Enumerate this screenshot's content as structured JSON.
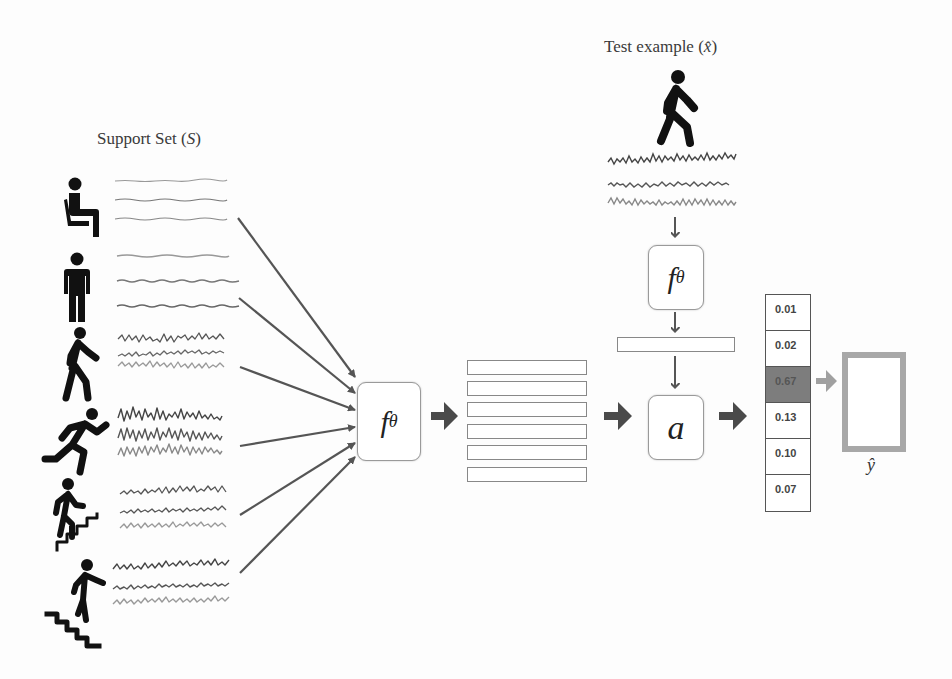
{
  "support_set": {
    "title_prefix": "Support Set (",
    "title_var": "S",
    "title_suffix": ")",
    "classes": [
      {
        "name": "sitting",
        "icon": "sitting-person-icon",
        "signal_activity": "low"
      },
      {
        "name": "standing",
        "icon": "standing-person-icon",
        "signal_activity": "low"
      },
      {
        "name": "walking",
        "icon": "walking-person-icon",
        "signal_activity": "medium"
      },
      {
        "name": "running",
        "icon": "running-person-icon",
        "signal_activity": "high"
      },
      {
        "name": "upstairs",
        "icon": "climbing-stairs-icon",
        "signal_activity": "medium"
      },
      {
        "name": "downstairs",
        "icon": "descending-stairs-icon",
        "signal_activity": "medium"
      }
    ]
  },
  "test_example": {
    "title_prefix": "Test example (",
    "title_var": "x̂",
    "title_suffix": ")",
    "icon": "walking-person-icon"
  },
  "encoder": {
    "label": "f",
    "subscript": "θ"
  },
  "attention": {
    "label": "a"
  },
  "probabilities": {
    "values": [
      "0.01",
      "0.02",
      "0.67",
      "0.13",
      "0.10",
      "0.07"
    ],
    "highlight_index": 2
  },
  "prediction": {
    "label": "ŷ",
    "icon": "walking-person-icon"
  },
  "colors": {
    "arrow": "#555555",
    "block_arrow": "#4a4a4a",
    "highlight_cell": "#7d7d7d",
    "output_border": "#a8a8a8",
    "signal_dark": "#4d4d4d",
    "signal_light": "#8a8a8a"
  }
}
